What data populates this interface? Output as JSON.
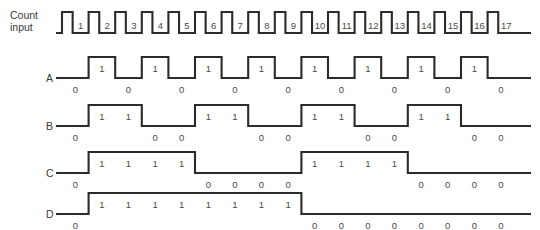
{
  "diagram": {
    "title_lines": [
      "Count",
      "input"
    ],
    "stroke_color": "#2b2b2b",
    "text_color": "#3a3a3a",
    "background": "#ffffff"
  },
  "clock": {
    "label_line1": "Count",
    "label_line2": "input",
    "pulse_labels": [
      "1",
      "2",
      "3",
      "4",
      "5",
      "6",
      "7",
      "8",
      "9",
      "10",
      "11",
      "12",
      "13",
      "14",
      "15",
      "16",
      "17"
    ],
    "pulse_count": 17
  },
  "rows": [
    {
      "label": "A",
      "divider": 2,
      "bits": [
        "0",
        "1",
        "0",
        "1",
        "0",
        "1",
        "0",
        "1",
        "0",
        "1",
        "0",
        "1",
        "0",
        "1",
        "0",
        "1",
        "0"
      ]
    },
    {
      "label": "B",
      "divider": 4,
      "bits": [
        "0",
        "1",
        "1",
        "0",
        "0",
        "1",
        "1",
        "0",
        "0",
        "1",
        "1",
        "0",
        "0",
        "1",
        "1",
        "0",
        "0"
      ]
    },
    {
      "label": "C",
      "divider": 8,
      "bits": [
        "0",
        "1",
        "1",
        "1",
        "1",
        "0",
        "0",
        "0",
        "0",
        "1",
        "1",
        "1",
        "1",
        "0",
        "0",
        "0",
        "0"
      ]
    },
    {
      "label": "D",
      "divider": 16,
      "bits": [
        "0",
        "1",
        "1",
        "1",
        "1",
        "1",
        "1",
        "1",
        "1",
        "0",
        "0",
        "0",
        "0",
        "0",
        "0",
        "0",
        "0"
      ]
    }
  ],
  "geometry": {
    "x_start": 62,
    "period": 26.6,
    "clock_low_y": 33,
    "clock_high_y": 12,
    "row_y": [
      {
        "low": 78,
        "high": 57
      },
      {
        "low": 126,
        "high": 105
      },
      {
        "low": 173,
        "high": 152
      },
      {
        "low": 214,
        "high": 193
      }
    ],
    "lead_x": 56,
    "tail_x": 531
  }
}
